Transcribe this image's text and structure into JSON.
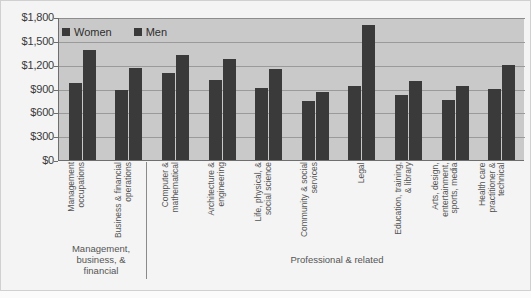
{
  "legend": {
    "position": "top-left",
    "items": [
      {
        "label": "Women",
        "color": "#3a3a3a"
      },
      {
        "label": "Men",
        "color": "#3a3a3a"
      }
    ]
  },
  "axis": {
    "y_ticks": [
      "$0",
      "$300",
      "$600",
      "$900",
      "$1,200",
      "$1,500",
      "$1,800"
    ]
  },
  "groups": [
    {
      "label": "Management, business, & financial"
    },
    {
      "label": "Professional & related"
    }
  ],
  "chart_data": {
    "type": "bar",
    "title": "",
    "subtitle": "",
    "xlabel": "",
    "ylabel": "",
    "ylim": [
      0,
      1800
    ],
    "ytick_values": [
      0,
      300,
      600,
      900,
      1200,
      1500,
      1800
    ],
    "ytick_labels": [
      "$0",
      "$300",
      "$600",
      "$900",
      "$1,200",
      "$1,500",
      "$1,800"
    ],
    "grid": true,
    "legend_position": "top-left",
    "categories": [
      "Management occupations",
      "Business & financial operations",
      "Computer & mathematical",
      "Architecture & engineering",
      "Life, physical, & social science",
      "Community & social services",
      "Legal",
      "Education, training, & library",
      "Arts, design, entertainment, sports, media",
      "Health care practitioner & technical"
    ],
    "group_membership": [
      "Management, business, & financial",
      "Management, business, & financial",
      "Professional & related",
      "Professional & related",
      "Professional & related",
      "Professional & related",
      "Professional & related",
      "Professional & related",
      "Professional & related",
      "Professional & related"
    ],
    "series": [
      {
        "name": "Women",
        "color": "#3a3a3a",
        "values": [
          970,
          880,
          1090,
          1010,
          910,
          740,
          930,
          820,
          760,
          890
        ]
      },
      {
        "name": "Men",
        "color": "#3a3a3a",
        "values": [
          1390,
          1160,
          1320,
          1270,
          1150,
          860,
          1700,
          1000,
          930,
          1200
        ]
      }
    ]
  }
}
